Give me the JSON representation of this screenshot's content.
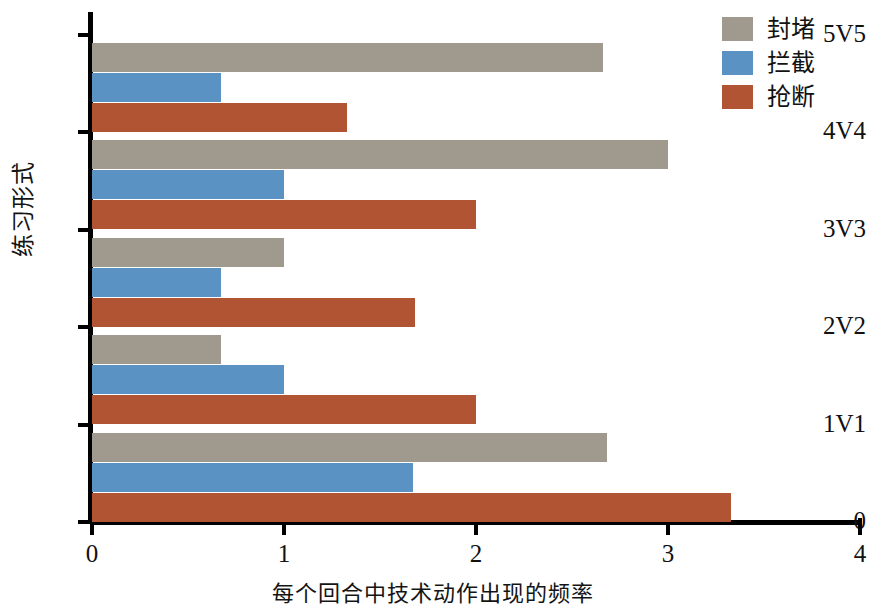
{
  "chart_data": {
    "type": "bar",
    "orientation": "horizontal",
    "title": "",
    "xlabel": "每个回合中技术动作出现的频率",
    "ylabel": "练习形式",
    "categories": [
      "1V1",
      "2V2",
      "3V3",
      "4V4",
      "5V5"
    ],
    "y_tick_labels": [
      "0",
      "1V1",
      "2V2",
      "3V3",
      "4V4",
      "5V5"
    ],
    "x_tick_labels": [
      "0",
      "1",
      "2",
      "3",
      "4"
    ],
    "x_ticks": [
      0,
      1,
      2,
      3,
      4
    ],
    "xlim": [
      0,
      4
    ],
    "grid": false,
    "legend_position": "top-right",
    "series": [
      {
        "name": "封堵",
        "color": "#a09a8e",
        "values": [
          2.68,
          0.67,
          1.0,
          3.0,
          2.66
        ]
      },
      {
        "name": "拦截",
        "color": "#5b92c4",
        "values": [
          1.67,
          1.0,
          0.67,
          1.0,
          0.67
        ]
      },
      {
        "name": "抢断",
        "color": "#b05433",
        "values": [
          3.33,
          2.0,
          1.68,
          2.0,
          1.33
        ]
      }
    ]
  },
  "legend": {
    "items": [
      {
        "label": "封堵",
        "color": "#a09a8e"
      },
      {
        "label": "拦截",
        "color": "#5b92c4"
      },
      {
        "label": "抢断",
        "color": "#b05433"
      }
    ]
  },
  "axes": {
    "x_title": "每个回合中技术动作出现的频率",
    "y_title": "练习形式"
  }
}
